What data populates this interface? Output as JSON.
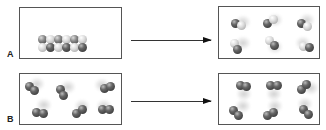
{
  "figure": {
    "type": "schematic",
    "panels": [
      {
        "label": "A",
        "before": "ordered solid row of heteronuclear diatomic molecules (alternating light/dark atoms)",
        "after": "six randomly oriented heteronuclear diatomic molecules (gas)",
        "molecule_count_after": 6
      },
      {
        "label": "B",
        "before": "six randomly oriented homonuclear diatomic molecules",
        "after": "six randomly oriented homonuclear diatomic molecules",
        "molecule_count_before": 6,
        "molecule_count_after": 6
      }
    ]
  },
  "labels": {
    "a": "A",
    "b": "B"
  },
  "colors": {
    "border": "#555555",
    "arrow": "#333333",
    "dark_atom": "#3a3a3a",
    "light_atom": "#dddddd"
  }
}
